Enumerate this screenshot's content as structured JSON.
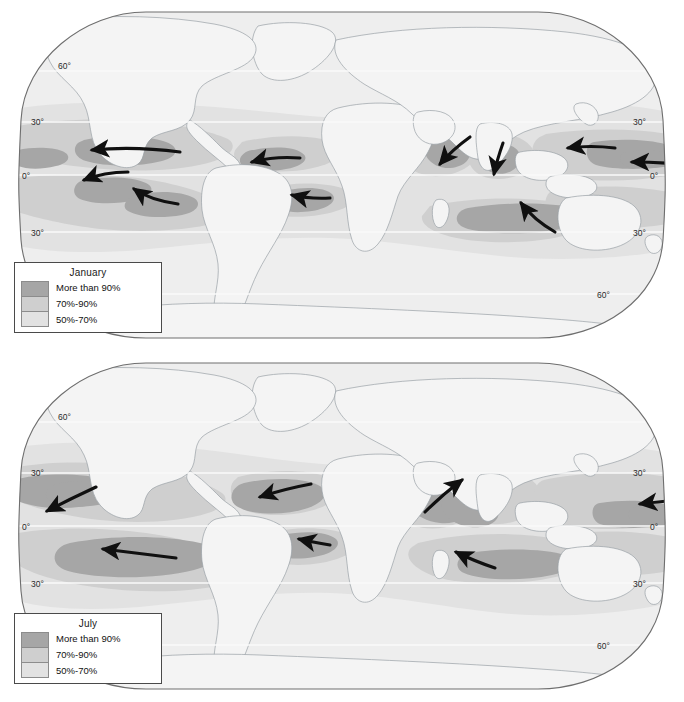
{
  "figure": {
    "panel_count": 2,
    "background_color": "#ffffff"
  },
  "colors": {
    "ocean_base": "#eeeeee",
    "land_fill": "#f4f4f4",
    "coastline": "#9aa0a6",
    "map_border": "#6e6e6e",
    "band_50_70": "#e2e2e2",
    "band_70_90": "#cfcfcf",
    "band_more_than_90": "#a6a6a6",
    "graticule": "#fafafa",
    "arrow": "#101010",
    "legend_border": "#4a4a4a",
    "text": "#1a1a1a"
  },
  "legend": {
    "swatch_order": [
      "more_than_90",
      "70_90",
      "50_70"
    ],
    "labels": [
      "More than 90%",
      "70%-90%",
      "50%-70%"
    ],
    "swatch_colors": [
      "#a6a6a6",
      "#cfcfcf",
      "#e2e2e2"
    ]
  },
  "panels": [
    {
      "id": "january",
      "title": "January",
      "latitude_labels_left": [
        "60°",
        "30°",
        "0°",
        "30°"
      ],
      "latitude_labels_right": [
        "30°",
        "0°",
        "30°",
        "60°"
      ],
      "arrows": [
        {
          "name": "north-pacific-east-trade",
          "from": [
            180,
            152
          ],
          "to": [
            88,
            150
          ],
          "desc": "Northeast trades, central North Pacific, blowing west"
        },
        {
          "name": "caribbean-trade",
          "from": [
            300,
            158
          ],
          "to": [
            248,
            162
          ],
          "desc": "Northeast trades, Caribbean / tropical North Atlantic, blowing west"
        },
        {
          "name": "south-pacific-southeast-trade",
          "from": [
            128,
            172
          ],
          "to": [
            80,
            180
          ],
          "desc": "Southeast trades, eastern South Pacific, blowing northwest"
        },
        {
          "name": "south-pacific-mid-trade",
          "from": [
            178,
            204
          ],
          "to": [
            131,
            188
          ],
          "desc": "Southeast trades, South Pacific, blowing northwest"
        },
        {
          "name": "south-atlantic-trade",
          "from": [
            330,
            198
          ],
          "to": [
            288,
            195
          ],
          "desc": "Southeast trades, South Atlantic, blowing west-northwest"
        },
        {
          "name": "arabian-sea-northeast-monsoon",
          "from": [
            470,
            137
          ],
          "to": [
            437,
            167
          ],
          "desc": "January northeast monsoon over the Arabian Sea"
        },
        {
          "name": "bay-of-bengal-northeast-monsoon",
          "from": [
            503,
            143
          ],
          "to": [
            493,
            177
          ],
          "desc": "January northeast monsoon over the Bay of Bengal"
        },
        {
          "name": "west-pacific-northeast-trade",
          "from": [
            615,
            148
          ],
          "to": [
            564,
            148
          ],
          "desc": "Northeast trades, western North Pacific, blowing west"
        },
        {
          "name": "east-pacific-edge-trade",
          "from": [
            678,
            164
          ],
          "to": [
            628,
            162
          ],
          "desc": "Northeast trades at eastern map edge, blowing west"
        },
        {
          "name": "coral-sea-southeast-trade",
          "from": [
            555,
            232
          ],
          "to": [
            518,
            200
          ],
          "desc": "Southeast trades approaching Australia, blowing northwest"
        }
      ]
    },
    {
      "id": "july",
      "title": "July",
      "latitude_labels_left": [
        "60°",
        "30°",
        "0°",
        "30°"
      ],
      "latitude_labels_right": [
        "30°",
        "0°",
        "30°",
        "60°"
      ],
      "arrows": [
        {
          "name": "north-pacific-northeast-trade-july",
          "from": [
            96,
            487
          ],
          "to": [
            43,
            512
          ],
          "desc": "Northeast trades, North Pacific, blowing southwest"
        },
        {
          "name": "north-atlantic-northeast-trade-july",
          "from": [
            311,
            484
          ],
          "to": [
            256,
            497
          ],
          "desc": "Northeast trades, tropical North Atlantic, blowing southwest"
        },
        {
          "name": "south-pacific-southeast-trade-july",
          "from": [
            176,
            558
          ],
          "to": [
            99,
            549
          ],
          "desc": "Southeast trades, South Pacific, blowing west-northwest"
        },
        {
          "name": "south-atlantic-trade-july",
          "from": [
            330,
            545
          ],
          "to": [
            295,
            539
          ],
          "desc": "Southeast trades, South Atlantic, blowing northwest"
        },
        {
          "name": "somali-jet-southwest-monsoon",
          "from": [
            425,
            512
          ],
          "to": [
            465,
            478
          ],
          "desc": "July southwest monsoon / Somali jet toward India"
        },
        {
          "name": "south-indian-southeast-trade-july",
          "from": [
            495,
            568
          ],
          "to": [
            452,
            551
          ],
          "desc": "Southeast trades, South Indian Ocean, blowing northwest"
        },
        {
          "name": "east-pacific-edge-trade-july",
          "from": [
            678,
            500
          ],
          "to": [
            636,
            504
          ],
          "desc": "Northeast trades at eastern map edge, blowing southwest"
        }
      ]
    }
  ]
}
